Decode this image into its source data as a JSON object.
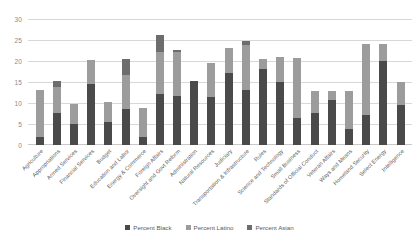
{
  "chart_data": {
    "type": "bar",
    "subtype": "stacked-vertical",
    "title": "",
    "xlabel": "",
    "ylabel": "",
    "ylim": [
      0,
      30
    ],
    "yticks": [
      0,
      5,
      10,
      15,
      20,
      25,
      30
    ],
    "grid": true,
    "legend_position": "bottom-center",
    "categories": [
      "Agriculture",
      "Appropriations",
      "Armed Services",
      "Financial Services",
      "Budget",
      "Education and Labor",
      "Energy & Commerce",
      "Foreign Affairs",
      "Oversight and Govt Reform",
      "Administration",
      "Natural Resources",
      "Judiciary",
      "Transportation & Infrastructure",
      "Rules",
      "Science and Technology",
      "Small Business",
      "Standards of Official Conduct",
      "Veteran Affairs",
      "Ways and Means",
      "Homeland Security",
      "Select Energy",
      "Intelligence"
    ],
    "series": [
      {
        "name": "Percent Black",
        "color": "#4a4a4a",
        "values": [
          2.0,
          7.7,
          5.0,
          14.6,
          5.5,
          8.5,
          2.0,
          12.2,
          11.7,
          15.2,
          11.5,
          17.2,
          13.0,
          18.0,
          15.0,
          6.5,
          7.7,
          10.7,
          3.8,
          7.2,
          20.0,
          9.5
        ]
      },
      {
        "name": "Percent Latino",
        "color": "#9c9c9c",
        "values": [
          11.0,
          6.0,
          4.7,
          5.7,
          4.8,
          8.2,
          6.8,
          9.9,
          10.5,
          0.0,
          8.0,
          6.0,
          10.8,
          2.5,
          6.0,
          14.2,
          5.2,
          2.2,
          9.0,
          16.8,
          4.0,
          5.5
        ]
      },
      {
        "name": "Percent Asian",
        "color": "#6d6d6d",
        "values": [
          0.0,
          1.6,
          0.0,
          0.0,
          0.0,
          3.8,
          0.0,
          4.1,
          0.5,
          0.0,
          0.0,
          0.0,
          1.0,
          0.0,
          0.0,
          0.0,
          0.0,
          0.0,
          0.0,
          0.0,
          0.0,
          0.0
        ]
      }
    ],
    "totals": [
      13.0,
      15.3,
      9.7,
      20.3,
      10.3,
      20.5,
      8.8,
      26.2,
      22.7,
      15.2,
      19.5,
      23.2,
      24.8,
      20.5,
      21.0,
      20.7,
      12.9,
      12.9,
      12.8,
      24.0,
      24.0,
      15.0
    ]
  },
  "legend": {
    "items": [
      {
        "label": "Percent Black",
        "color": "#4a4a4a"
      },
      {
        "label": "Percent Latino",
        "color": "#9c9c9c"
      },
      {
        "label": "Percent Asian",
        "color": "#6d6d6d"
      }
    ]
  },
  "watermark": {
    "text": ""
  }
}
